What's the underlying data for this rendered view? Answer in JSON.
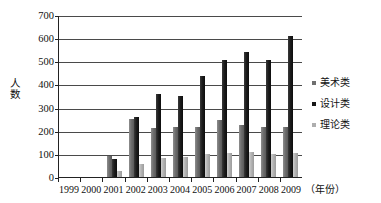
{
  "chart_data": {
    "type": "bar",
    "title": "",
    "subtitle": "",
    "xlabel": "（年份）",
    "ylabel": "人数",
    "ylim": [
      0,
      700
    ],
    "ytick_step": 100,
    "yticks": [
      "700",
      "600",
      "500",
      "400",
      "300",
      "200",
      "100",
      "0"
    ],
    "grid": true,
    "legend_position": "right",
    "categories": [
      "1999",
      "2000",
      "2001",
      "2002",
      "2003",
      "2004",
      "2005",
      "2006",
      "2007",
      "2008",
      "2009"
    ],
    "series": [
      {
        "name": "美术类",
        "color": "#6f6f6f",
        "values": [
          0,
          0,
          90,
          250,
          212,
          215,
          218,
          245,
          225,
          215,
          218
        ]
      },
      {
        "name": "设计类",
        "color": "#171717",
        "values": [
          0,
          0,
          80,
          260,
          360,
          352,
          435,
          505,
          540,
          505,
          608
        ]
      },
      {
        "name": "理论类",
        "color": "#aeaeae",
        "values": [
          0,
          0,
          25,
          55,
          82,
          85,
          100,
          105,
          108,
          100,
          103
        ]
      }
    ]
  },
  "axis": {
    "y_title": "人数",
    "x_unit": "（年份）"
  }
}
